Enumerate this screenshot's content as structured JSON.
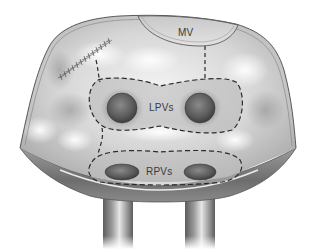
{
  "diagram": {
    "labels": {
      "mitral_valve": "MV",
      "left_pulmonary_veins": "LPVs",
      "right_pulmonary_veins": "RPVs"
    },
    "elements": [
      {
        "id": "atrial-wall",
        "type": "opened-chamber-outline"
      },
      {
        "id": "mitral-valve",
        "type": "arc-region",
        "label_key": "mitral_valve"
      },
      {
        "id": "suture-line",
        "type": "suture-stitches"
      },
      {
        "id": "lpv-encircling-lesion",
        "type": "dashed-loop",
        "encloses": "left_pulmonary_veins"
      },
      {
        "id": "rpv-encircling-lesion",
        "type": "dashed-loop",
        "encloses": "right_pulmonary_veins"
      },
      {
        "id": "mitral-connecting-lesion",
        "type": "dashed-line",
        "from": "mitral-valve",
        "to": "lpv-encircling-lesion"
      },
      {
        "id": "suture-connecting-lesion",
        "type": "dashed-line",
        "from": "suture-line",
        "to": "lpv-encircling-lesion"
      },
      {
        "id": "pv-connecting-lesion",
        "type": "dashed-line",
        "from": "lpv-encircling-lesion",
        "to": "rpv-encircling-lesion"
      },
      {
        "id": "vein-stumps",
        "type": "tubular-vessels",
        "count": 2
      }
    ],
    "colors": {
      "tissue_light": "#f2f2f2",
      "tissue_mid": "#bdbdbd",
      "tissue_dark": "#6e6e6e",
      "vein_orifice": "#555555",
      "lesion_line": "#2a2a2a",
      "outline": "#444444",
      "label_text": "#3a3a3a"
    }
  }
}
